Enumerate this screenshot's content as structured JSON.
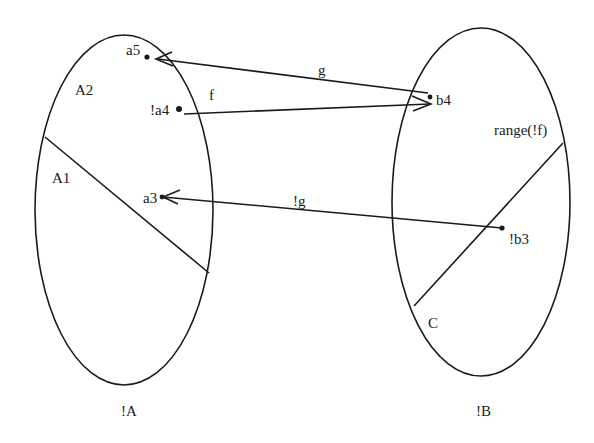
{
  "diagram": {
    "type": "set-mapping",
    "sets": [
      {
        "id": "A",
        "label": "!A",
        "regions": [
          "A2",
          "A1"
        ],
        "elements": [
          "a5",
          "!a4",
          "a3"
        ]
      },
      {
        "id": "B",
        "label": "!B",
        "regions": [
          "range(!f)",
          "C"
        ],
        "elements": [
          "b4",
          "!b3"
        ]
      }
    ],
    "labels": {
      "set_a": "!A",
      "set_b": "!B",
      "region_a2": "A2",
      "region_a1": "A1",
      "region_range": "range(!f)",
      "region_c": "C",
      "elem_a5": "a5",
      "elem_a4": "!a4",
      "elem_a3": "a3",
      "elem_b4": "b4",
      "elem_b3": "!b3"
    },
    "arrows": [
      {
        "id": "g",
        "label": "g",
        "from": "b4",
        "to": "a5"
      },
      {
        "id": "f",
        "label": "f",
        "from": "!a4",
        "to": "b4"
      },
      {
        "id": "not-g",
        "label": "!g",
        "from": "!b3",
        "to": "a3"
      }
    ],
    "colors": {
      "ink": "#1a1a1a",
      "background": "#ffffff"
    }
  }
}
